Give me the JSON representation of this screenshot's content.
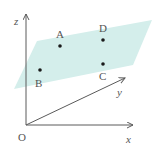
{
  "diagram": {
    "type": "3d-coordinate-plane",
    "colors": {
      "plane": "#d4eeeb",
      "axis": "#5a5a5a",
      "point": "#1a1a1a",
      "text": "#555555"
    },
    "origin": {
      "label": "O",
      "x": 26,
      "y": 125,
      "label_x": 18,
      "label_y": 141
    },
    "axes": [
      {
        "name": "x",
        "label": "x",
        "from": [
          26,
          125
        ],
        "to": [
          133,
          125
        ],
        "label_x": 126,
        "label_y": 143
      },
      {
        "name": "y",
        "label": "y",
        "from": [
          26,
          125
        ],
        "to": [
          125,
          78
        ],
        "label_x": 117,
        "label_y": 96
      },
      {
        "name": "z",
        "label": "z",
        "from": [
          26,
          125
        ],
        "to": [
          26,
          14
        ],
        "label_x": 14,
        "label_y": 25
      }
    ],
    "plane": {
      "points": "37,41 152,20 133,65 14,89"
    },
    "points": [
      {
        "label": "A",
        "x": 60,
        "y": 46,
        "label_x": 56,
        "label_y": 38
      },
      {
        "label": "D",
        "x": 103,
        "y": 40,
        "label_x": 99,
        "label_y": 32
      },
      {
        "label": "C",
        "x": 103,
        "y": 64,
        "label_x": 99,
        "label_y": 80
      },
      {
        "label": "B",
        "x": 40,
        "y": 70,
        "label_x": 35,
        "label_y": 87
      }
    ]
  }
}
